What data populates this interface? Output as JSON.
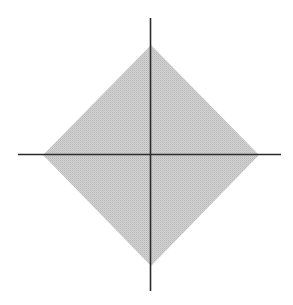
{
  "figure": {
    "title": "",
    "width": 293,
    "height": 305,
    "background_color": "#ffffff"
  },
  "axes": {
    "origin": {
      "x": 150.5,
      "y": 154.5
    },
    "line_color": "#2b2b2b",
    "line_width": 1.6,
    "x_axis": {
      "name": "x-axis",
      "x_start": 18,
      "x_end": 281,
      "y": 154.5,
      "label": "",
      "ticks": [],
      "tick_labels": []
    },
    "y_axis": {
      "name": "y-axis",
      "y_start": 18,
      "y_end": 291,
      "x": 150.5,
      "label": "",
      "ticks": [],
      "tick_labels": []
    }
  },
  "region": {
    "name": "diamond-region",
    "shape": "diamond",
    "description": "shaded rotated square (absolute-value inequality region)",
    "fill_color": "#c8c8c8",
    "fill_pattern": "halftone-dither",
    "stroke": "none",
    "vertices": [
      {
        "name": "left-vertex",
        "x": 43,
        "y": 155
      },
      {
        "name": "top-vertex",
        "x": 151,
        "y": 45
      },
      {
        "name": "right-vertex",
        "x": 259,
        "y": 155
      },
      {
        "name": "bottom-vertex",
        "x": 151,
        "y": 266
      }
    ],
    "half_width": 108,
    "half_height": 110
  },
  "chart_data": {
    "type": "area",
    "title": "",
    "subtitle": "",
    "xlabel": "",
    "ylabel": "",
    "xlim": [
      -122,
      121
    ],
    "ylim": [
      -136,
      136
    ],
    "grid": false,
    "legend": [],
    "legend_position": "none",
    "annotations": [],
    "series": [
      {
        "name": "shaded-diamond-region",
        "type": "polygon",
        "closed": true,
        "fill": "#c8c8c8",
        "x": [
          -107.5,
          0.5,
          108.5,
          0.5
        ],
        "y": [
          0,
          110,
          0,
          -111
        ],
        "vertex_labels": [
          "left",
          "top",
          "right",
          "bottom"
        ]
      },
      {
        "name": "x-axis-line",
        "type": "line",
        "x": [
          -132.5,
          130.5
        ],
        "y": [
          0,
          0
        ],
        "color": "#2b2b2b"
      },
      {
        "name": "y-axis-line",
        "type": "line",
        "x": [
          0,
          0
        ],
        "y": [
          136.5,
          -136.5
        ],
        "color": "#2b2b2b"
      }
    ]
  }
}
